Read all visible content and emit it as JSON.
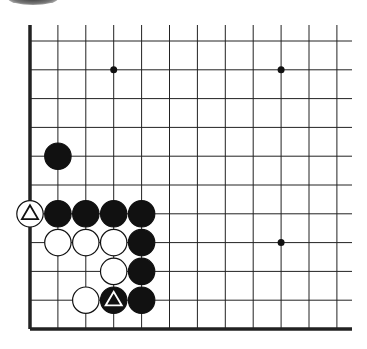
{
  "diagram": {
    "type": "go-board-fragment",
    "columns": 12,
    "rows": 11,
    "edges": {
      "left": "board-edge",
      "bottom": "board-edge",
      "top": "open",
      "right": "open"
    },
    "colors": {
      "black_stone": "#111111",
      "white_stone": "#ffffff",
      "line": "#222222",
      "background": "#ffffff"
    },
    "star_points": [
      {
        "col": 3,
        "row": 1
      },
      {
        "col": 9,
        "row": 1
      },
      {
        "col": 9,
        "row": 7
      }
    ],
    "stones": [
      {
        "color": "black",
        "col": 1,
        "row": 4,
        "mark": ""
      },
      {
        "color": "white",
        "col": 0,
        "row": 6,
        "mark": "triangle"
      },
      {
        "color": "black",
        "col": 1,
        "row": 6,
        "mark": ""
      },
      {
        "color": "black",
        "col": 2,
        "row": 6,
        "mark": ""
      },
      {
        "color": "black",
        "col": 3,
        "row": 6,
        "mark": ""
      },
      {
        "color": "black",
        "col": 4,
        "row": 6,
        "mark": ""
      },
      {
        "color": "white",
        "col": 1,
        "row": 7,
        "mark": ""
      },
      {
        "color": "white",
        "col": 2,
        "row": 7,
        "mark": ""
      },
      {
        "color": "white",
        "col": 3,
        "row": 7,
        "mark": ""
      },
      {
        "color": "black",
        "col": 4,
        "row": 7,
        "mark": ""
      },
      {
        "color": "white",
        "col": 3,
        "row": 8,
        "mark": ""
      },
      {
        "color": "black",
        "col": 4,
        "row": 8,
        "mark": ""
      },
      {
        "color": "white",
        "col": 2,
        "row": 9,
        "mark": ""
      },
      {
        "color": "black",
        "col": 3,
        "row": 9,
        "mark": "triangle"
      },
      {
        "color": "black",
        "col": 4,
        "row": 9,
        "mark": ""
      }
    ]
  }
}
